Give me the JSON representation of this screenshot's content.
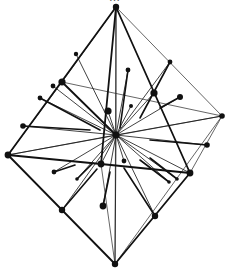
{
  "figure": {
    "caption_cut_off": "…"
  },
  "colors": {
    "background": "#ffffff",
    "ink": "#111111",
    "faint_ink": "#555555"
  },
  "octahedron": {
    "vertices": {
      "top": [
        116,
        7
      ],
      "bottom": [
        115,
        264
      ],
      "left": [
        8,
        155
      ],
      "right": [
        222,
        116
      ],
      "front": [
        101,
        164
      ],
      "front_right": [
        190,
        173
      ],
      "back_left": [
        62,
        82
      ]
    },
    "center": [
      116,
      135
    ],
    "edges_bold": [
      [
        "top",
        "left"
      ],
      [
        "top",
        "front"
      ],
      [
        "top",
        "front_right"
      ],
      [
        "left",
        "front"
      ],
      [
        "front",
        "front_right"
      ],
      [
        "left",
        "bottom"
      ],
      [
        "front_right",
        "bottom"
      ],
      [
        "back_left",
        "center"
      ]
    ],
    "edges_thin": [
      [
        "top",
        "right"
      ],
      [
        "right",
        "front_right"
      ],
      [
        "right",
        "bottom"
      ],
      [
        "top",
        "back_left"
      ],
      [
        "back_left",
        "left"
      ],
      [
        "front",
        "bottom"
      ],
      [
        "top",
        "bottom"
      ],
      [
        "left",
        "right"
      ],
      [
        "back_left",
        "right"
      ]
    ]
  },
  "spokes": [
    [
      8,
      155
    ],
    [
      222,
      116
    ],
    [
      101,
      164
    ],
    [
      190,
      173
    ],
    [
      62,
      82
    ],
    [
      116,
      7
    ],
    [
      115,
      264
    ],
    [
      170,
      62
    ],
    [
      154,
      93
    ],
    [
      40,
      98
    ],
    [
      23,
      126
    ],
    [
      53,
      86
    ],
    [
      76,
      54
    ],
    [
      207,
      145
    ],
    [
      155,
      216
    ],
    [
      62,
      210
    ],
    [
      77,
      179
    ],
    [
      169,
      182
    ],
    [
      177,
      179
    ],
    [
      54,
      172
    ],
    [
      128,
      70
    ],
    [
      131,
      106
    ],
    [
      103,
      206
    ],
    [
      124,
      161
    ],
    [
      180,
      97
    ],
    [
      108,
      111
    ]
  ],
  "balls": [
    {
      "pos": [
        116,
        7
      ],
      "r": 3.2
    },
    {
      "pos": [
        115,
        264
      ],
      "r": 3.2
    },
    {
      "pos": [
        8,
        155
      ],
      "r": 3.4
    },
    {
      "pos": [
        222,
        116
      ],
      "r": 2.8
    },
    {
      "pos": [
        101,
        164
      ],
      "r": 3.4
    },
    {
      "pos": [
        190,
        173
      ],
      "r": 3.4
    },
    {
      "pos": [
        62,
        82
      ],
      "r": 3.6
    },
    {
      "pos": [
        116,
        135
      ],
      "r": 3.6
    },
    {
      "pos": [
        170,
        62
      ],
      "r": 2.4
    },
    {
      "pos": [
        154,
        93
      ],
      "r": 3.6
    },
    {
      "pos": [
        180,
        97
      ],
      "r": 3.0
    },
    {
      "pos": [
        53,
        86
      ],
      "r": 2.4
    },
    {
      "pos": [
        40,
        98
      ],
      "r": 2.4
    },
    {
      "pos": [
        76,
        54
      ],
      "r": 2.2
    },
    {
      "pos": [
        23,
        126
      ],
      "r": 2.8
    },
    {
      "pos": [
        207,
        145
      ],
      "r": 2.8
    },
    {
      "pos": [
        155,
        216
      ],
      "r": 3.2
    },
    {
      "pos": [
        62,
        210
      ],
      "r": 3.2
    },
    {
      "pos": [
        103,
        206
      ],
      "r": 3.4
    },
    {
      "pos": [
        54,
        172
      ],
      "r": 2.4
    },
    {
      "pos": [
        77,
        179
      ],
      "r": 1.8
    },
    {
      "pos": [
        169,
        182
      ],
      "r": 1.8
    },
    {
      "pos": [
        177,
        179
      ],
      "r": 1.8
    },
    {
      "pos": [
        128,
        70
      ],
      "r": 2.4
    },
    {
      "pos": [
        131,
        106
      ],
      "r": 2.0
    },
    {
      "pos": [
        108,
        111
      ],
      "r": 3.6
    },
    {
      "pos": [
        124,
        161
      ],
      "r": 2.4
    }
  ],
  "stick_segments": [
    [
      [
        54,
        172
      ],
      [
        75,
        165
      ]
    ],
    [
      [
        77,
        179
      ],
      [
        93,
        163
      ]
    ],
    [
      [
        62,
        210
      ],
      [
        97,
        169
      ]
    ],
    [
      [
        103,
        206
      ],
      [
        110,
        172
      ]
    ],
    [
      [
        155,
        216
      ],
      [
        124,
        168
      ]
    ],
    [
      [
        169,
        182
      ],
      [
        140,
        160
      ]
    ],
    [
      [
        177,
        179
      ],
      [
        150,
        158
      ]
    ],
    [
      [
        180,
        97
      ],
      [
        160,
        108
      ]
    ],
    [
      [
        128,
        70
      ],
      [
        120,
        128
      ]
    ],
    [
      [
        207,
        145
      ],
      [
        150,
        140
      ]
    ],
    [
      [
        170,
        62
      ],
      [
        140,
        118
      ]
    ],
    [
      [
        23,
        126
      ],
      [
        90,
        130
      ]
    ],
    [
      [
        40,
        98
      ],
      [
        100,
        130
      ]
    ]
  ]
}
